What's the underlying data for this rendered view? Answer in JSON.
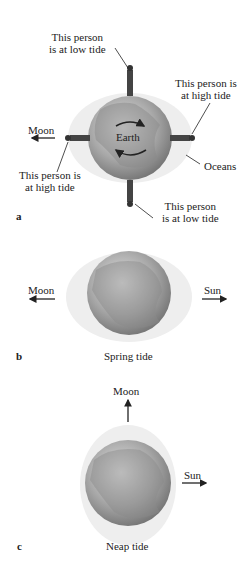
{
  "panel_a": {
    "letter": "a",
    "earth_label": "Earth",
    "moon_label": "Moon",
    "oceans_label": "Oceans",
    "top_person": [
      "This person",
      "is at low tide"
    ],
    "right_person": [
      "This person is",
      "at high tide"
    ],
    "left_person": [
      "This person is",
      "at high tide"
    ],
    "bottom_person": [
      "This person",
      "is at low tide"
    ]
  },
  "panel_b": {
    "letter": "b",
    "moon_label": "Moon",
    "sun_label": "Sun",
    "caption": "Spring tide"
  },
  "panel_c": {
    "letter": "c",
    "moon_label": "Moon",
    "sun_label": "Sun",
    "caption": "Neap tide"
  },
  "colors": {
    "ocean_bulge": "#eeeeee",
    "earth_dark": "#6e6e6e",
    "earth_light": "#d8d8d8",
    "ink": "#222222"
  }
}
